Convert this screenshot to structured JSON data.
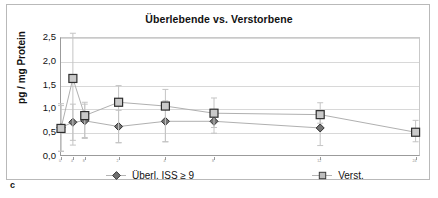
{
  "panel": {
    "letter": "c"
  },
  "chart_data": {
    "type": "scatter",
    "title": "Überlebende vs. Verstorbene",
    "xlabel": "",
    "ylabel": "pg / mg Protein",
    "ylim": [
      0.0,
      2.5
    ],
    "ytick_labels": [
      "0,0",
      "0,5",
      "1,0",
      "1,5",
      "2,0",
      "2,5"
    ],
    "ytick_values": [
      0.0,
      0.5,
      1.0,
      1.5,
      2.0,
      2.5
    ],
    "grid": true,
    "legend_position": "bottom",
    "xtick_labels": [
      "0",
      "4",
      "8",
      "2",
      "4",
      "8",
      "12",
      "24"
    ],
    "xtick_positions": [
      0.0,
      3.3,
      6.6,
      16.0,
      29.0,
      42.5,
      72.0,
      98.5
    ],
    "series": [
      {
        "name": "Überl. ISS ≥ 9",
        "marker": "diamond",
        "color": "#6b6b6b",
        "x": [
          0.0,
          3.3,
          6.6,
          16.0,
          29.0,
          42.5,
          72.0
        ],
        "values": [
          0.62,
          0.73,
          0.76,
          0.64,
          0.75,
          0.75,
          0.61
        ],
        "err_low": [
          0.5,
          0.38,
          0.35,
          0.34,
          0.43,
          0.25,
          0.37
        ],
        "err_high": [
          0.5,
          0.38,
          0.35,
          0.34,
          0.43,
          0.25,
          0.37
        ]
      },
      {
        "name": "Verst.",
        "marker": "square",
        "color": "#8a8a8a",
        "x": [
          0.0,
          3.3,
          6.6,
          16.0,
          29.0,
          42.5,
          72.0,
          98.5
        ],
        "values": [
          0.6,
          1.65,
          0.87,
          1.15,
          1.07,
          0.92,
          0.89,
          0.52
        ],
        "err_low": [
          0.48,
          1.4,
          0.48,
          0.85,
          0.75,
          0.3,
          0.18,
          0.2
        ],
        "err_high": [
          0.48,
          0.95,
          0.28,
          0.35,
          0.35,
          0.32,
          0.25,
          0.25
        ]
      }
    ]
  }
}
